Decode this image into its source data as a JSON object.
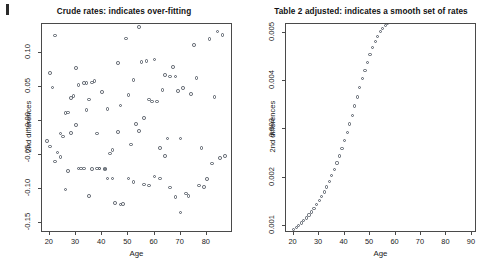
{
  "figure": {
    "width": 495,
    "height": 275,
    "background": "#ffffff",
    "marker_color": "#555c66",
    "frame_color": "#4a4a4a",
    "text_color": "#1a1a1a"
  },
  "chart_data": [
    {
      "type": "scatter",
      "panel": "left",
      "title": "Crude rates: indicates over-fitting",
      "xlabel": "Age",
      "ylabel": "2nd differences",
      "xlim": [
        17,
        90
      ],
      "ylim": [
        -0.165,
        0.142
      ],
      "xticks": [
        20,
        30,
        40,
        50,
        60,
        70,
        80
      ],
      "xtick_labels": [
        "20",
        "30",
        "40",
        "50",
        "60",
        "70",
        "80"
      ],
      "yticks": [
        -0.15,
        -0.1,
        -0.05,
        0.0,
        0.05,
        0.1
      ],
      "ytick_labels": [
        "-0.15",
        "-0.10",
        "-0.05",
        "0.00",
        "0.05",
        "0.10"
      ],
      "grid": false,
      "legend": null,
      "marker": "open-circle",
      "x": [
        19,
        20,
        20,
        21,
        22,
        22,
        23,
        24,
        24,
        25,
        26,
        26,
        27,
        27,
        28,
        28,
        29,
        30,
        30,
        31,
        31,
        32,
        33,
        33,
        34,
        34,
        35,
        35,
        36,
        36,
        37,
        38,
        38,
        39,
        39,
        40,
        41,
        41,
        42,
        42,
        43,
        44,
        44,
        45,
        46,
        46,
        47,
        47,
        48,
        49,
        50,
        50,
        51,
        52,
        52,
        53,
        54,
        54,
        55,
        56,
        56,
        57,
        58,
        58,
        59,
        60,
        60,
        61,
        62,
        62,
        63,
        64,
        64,
        65,
        66,
        66,
        67,
        68,
        68,
        69,
        70,
        70,
        71,
        72,
        73,
        74,
        75,
        76,
        77,
        78,
        79,
        80,
        81,
        82,
        83,
        84,
        85,
        86,
        87
      ],
      "y": [
        -0.03,
        0.07,
        -0.038,
        0.049,
        -0.06,
        0.125,
        -0.047,
        -0.053,
        -0.019,
        -0.023,
        -0.101,
        0.011,
        0.012,
        -0.074,
        0.033,
        -0.018,
        0.036,
        -0.006,
        0.077,
        -0.07,
        0.052,
        -0.07,
        0.055,
        -0.07,
        0.055,
        0.016,
        0.031,
        -0.111,
        -0.071,
        0.056,
        0.058,
        -0.019,
        -0.07,
        -0.07,
        -0.07,
        0.042,
        -0.07,
        -0.072,
        -0.085,
        0.017,
        -0.048,
        -0.043,
        -0.085,
        -0.121,
        0.085,
        -0.017,
        -0.123,
        0.022,
        -0.122,
        0.121,
        0.038,
        -0.085,
        -0.035,
        0.06,
        -0.09,
        -0.005,
        0.138,
        -0.015,
        0.086,
        0.004,
        -0.094,
        0.088,
        0.031,
        -0.095,
        0.028,
        0.09,
        -0.082,
        0.028,
        -0.085,
        -0.04,
        0.045,
        0.067,
        -0.052,
        -0.026,
        0.065,
        -0.098,
        0.079,
        0.065,
        -0.112,
        0.044,
        -0.026,
        -0.135,
        0.048,
        -0.107,
        -0.111,
        0.039,
        0.111,
        0.063,
        -0.095,
        -0.04,
        -0.097,
        -0.086,
        0.12,
        -0.063,
        0.035,
        0.131,
        -0.055,
        0.126,
        -0.052,
        -0.163
      ]
    },
    {
      "type": "scatter",
      "panel": "right",
      "title": "Table 2 adjusted: indicates a smooth set of rates",
      "xlabel": "Age",
      "ylabel": "2nd differences",
      "xlim": [
        17,
        92
      ],
      "ylim": [
        0.00086,
        0.00518
      ],
      "xticks": [
        20,
        30,
        40,
        50,
        60,
        70,
        80,
        90
      ],
      "xtick_labels": [
        "20",
        "30",
        "40",
        "50",
        "60",
        "70",
        "80",
        "90"
      ],
      "yticks": [
        0.001,
        0.002,
        0.003,
        0.004,
        0.005
      ],
      "ytick_labels": [
        "0.001",
        "0.002",
        "0.003",
        "0.004",
        "0.005"
      ],
      "grid": false,
      "legend": null,
      "marker": "open-circle",
      "curve_shape": "logistic",
      "x": [
        20,
        21,
        22,
        23,
        24,
        25,
        26,
        27,
        28,
        29,
        30,
        31,
        32,
        33,
        34,
        35,
        36,
        37,
        38,
        39,
        40,
        41,
        42,
        43,
        44,
        45,
        46,
        47,
        48,
        49,
        50,
        51,
        52,
        53,
        54,
        55,
        56,
        57,
        58,
        59,
        60,
        61,
        62,
        63,
        64,
        65,
        66,
        67,
        68,
        69,
        70,
        71,
        72,
        73,
        74,
        75,
        76,
        77,
        78,
        79,
        80,
        81,
        82,
        83,
        84,
        85,
        86,
        87,
        88
      ],
      "y": [
        0.000935,
        0.000975,
        0.001018,
        0.001065,
        0.001116,
        0.001171,
        0.001231,
        0.001296,
        0.001366,
        0.001442,
        0.001524,
        0.001613,
        0.001709,
        0.001812,
        0.001923,
        0.002042,
        0.00217,
        0.002306,
        0.002451,
        0.002605,
        0.002767,
        0.002937,
        0.003114,
        0.003297,
        0.003484,
        0.003673,
        0.003861,
        0.004046,
        0.004224,
        0.004392,
        0.004548,
        0.00469,
        0.004816,
        0.004925,
        0.005017,
        0.005093,
        0.005154,
        0.005202,
        0.005239,
        0.005267,
        0.005287,
        0.005302,
        0.005313,
        0.005321,
        0.005327,
        0.005331,
        0.005334,
        0.005336,
        0.005338,
        0.005339,
        0.00534,
        0.005341,
        0.005341,
        0.005342,
        0.005342,
        0.005342,
        0.005343,
        0.005343,
        0.005343,
        0.005343,
        0.005343,
        0.005343,
        0.005343,
        0.005343,
        0.005343,
        0.005343,
        0.005343,
        0.005343,
        0.005343
      ]
    }
  ]
}
